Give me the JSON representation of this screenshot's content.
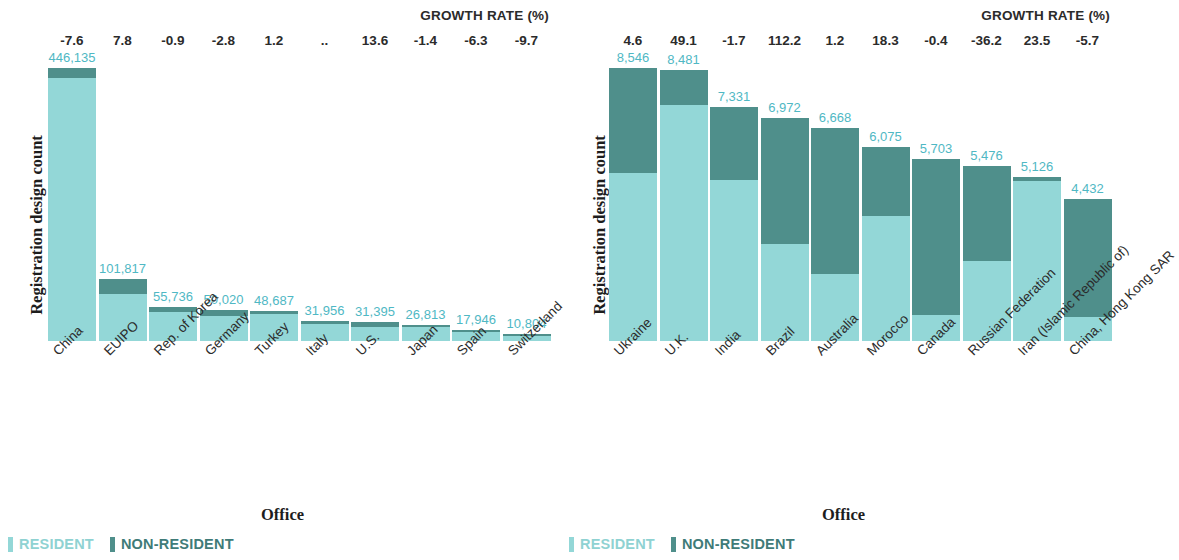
{
  "colors": {
    "resident": "#93d7d7",
    "non_resident": "#4f8f8b",
    "value_label": "#4fb8c4",
    "text": "#2b2b2b"
  },
  "legend": {
    "resident_label": "RESIDENT",
    "non_resident_label": "NON-RESIDENT"
  },
  "chart_data": [
    {
      "type": "bar",
      "stacked": true,
      "panel": "left",
      "title": "",
      "growth_header": "GROWTH RATE (%)",
      "xlabel": "Office",
      "ylabel": "Registration design count",
      "grid": false,
      "legend_position": "bottom-left",
      "ylim": [
        0,
        460000
      ],
      "categories": [
        "China",
        "EUIPO",
        "Rep. of Korea",
        "Germany",
        "Turkey",
        "Italy",
        "U.S.",
        "Japan",
        "Spain",
        "Switzerland"
      ],
      "totals": [
        446135,
        101817,
        55736,
        50020,
        48687,
        31956,
        31395,
        26813,
        17946,
        10804
      ],
      "total_labels": [
        "446,135",
        "101,817",
        "55,736",
        "50,020",
        "48,687",
        "31,956",
        "31,395",
        "26,813",
        "17,946",
        "10,804"
      ],
      "growth_rates": [
        "-7.6",
        "7.8",
        "-0.9",
        "-2.8",
        "1.2",
        "..",
        "13.6",
        "-1.4",
        "-6.3",
        "-9.7"
      ],
      "series": [
        {
          "name": "RESIDENT",
          "values": [
            430000,
            77500,
            48000,
            41000,
            43500,
            28000,
            22500,
            22500,
            14500,
            8300
          ]
        },
        {
          "name": "NON-RESIDENT",
          "values": [
            16135,
            24317,
            7736,
            9020,
            5187,
            3956,
            8895,
            4313,
            3446,
            2504
          ]
        }
      ]
    },
    {
      "type": "bar",
      "stacked": true,
      "panel": "right",
      "title": "",
      "growth_header": "GROWTH RATE (%)",
      "xlabel": "Office",
      "ylabel": "Registration design count",
      "grid": false,
      "legend_position": "bottom-left",
      "ylim": [
        0,
        8800
      ],
      "categories": [
        "Ukraine",
        "U.K.",
        "India",
        "Brazil",
        "Australia",
        "Morocco",
        "Canada",
        "Russian Federation",
        "Iran (Islamic Republic of)",
        "China, Hong Kong SAR"
      ],
      "totals": [
        8546,
        8481,
        7331,
        6972,
        6668,
        6075,
        5703,
        5476,
        5126,
        4432
      ],
      "total_labels": [
        "8,546",
        "8,481",
        "7,331",
        "6,972",
        "6,668",
        "6,075",
        "5,703",
        "5,476",
        "5,126",
        "4,432"
      ],
      "growth_rates": [
        "4.6",
        "49.1",
        "-1.7",
        "112.2",
        "1.2",
        "18.3",
        "-0.4",
        "-36.2",
        "23.5",
        "-5.7"
      ],
      "series": [
        {
          "name": "RESIDENT",
          "values": [
            5250,
            7400,
            5050,
            3050,
            2100,
            3900,
            800,
            2500,
            5000,
            750
          ]
        },
        {
          "name": "NON-RESIDENT",
          "values": [
            3296,
            1081,
            2281,
            3922,
            4568,
            2175,
            4903,
            2976,
            126,
            3682
          ]
        }
      ]
    }
  ]
}
